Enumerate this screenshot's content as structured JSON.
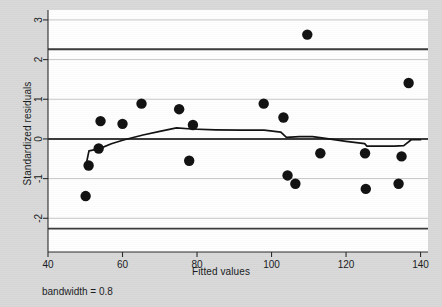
{
  "figure": {
    "background_color": "#d9d9d9",
    "panel_color": "#ffffff",
    "note": "bandwidth = 0.8"
  },
  "chart_data": {
    "type": "scatter",
    "title": "",
    "subtitle": "",
    "xlabel": "Fitted values",
    "ylabel": "Standardized residuals",
    "xlim": [
      40,
      142
    ],
    "ylim": [
      -2.85,
      3.25
    ],
    "xticks": [
      40,
      60,
      80,
      100,
      120,
      140
    ],
    "xtick_labels": [
      "40",
      "60",
      "80",
      "100",
      "120",
      "140"
    ],
    "yticks": [
      -2,
      -1,
      0,
      1,
      2,
      3
    ],
    "ytick_labels": [
      "-2",
      "-1",
      "0",
      "1",
      "2",
      "3"
    ],
    "grid": true,
    "grid_axis": "y",
    "grid_color": "#c8c8c8",
    "legend": false,
    "legend_position": "none",
    "marker_color": "#111111",
    "marker_size": 5.2,
    "series": [
      {
        "name": "Standardized residuals vs fitted values",
        "type": "scatter",
        "points": [
          {
            "x": 50.1,
            "y": -1.44
          },
          {
            "x": 50.9,
            "y": -0.67
          },
          {
            "x": 53.6,
            "y": -0.24
          },
          {
            "x": 54.1,
            "y": 0.45
          },
          {
            "x": 60.0,
            "y": 0.38
          },
          {
            "x": 65.1,
            "y": 0.89
          },
          {
            "x": 75.2,
            "y": 0.75
          },
          {
            "x": 77.9,
            "y": -0.55
          },
          {
            "x": 78.9,
            "y": 0.35
          },
          {
            "x": 97.9,
            "y": 0.89
          },
          {
            "x": 103.2,
            "y": 0.54
          },
          {
            "x": 104.3,
            "y": -0.92
          },
          {
            "x": 106.4,
            "y": -1.13
          },
          {
            "x": 109.6,
            "y": 2.63
          },
          {
            "x": 113.1,
            "y": -0.36
          },
          {
            "x": 125.1,
            "y": -0.36
          },
          {
            "x": 125.3,
            "y": -1.26
          },
          {
            "x": 134.1,
            "y": -1.13
          },
          {
            "x": 134.9,
            "y": -0.44
          },
          {
            "x": 136.8,
            "y": 1.41
          }
        ]
      },
      {
        "name": "lowess smoother",
        "type": "line",
        "color": "#111111",
        "points": [
          {
            "x": 50.2,
            "y": -0.66
          },
          {
            "x": 51.0,
            "y": -0.3
          },
          {
            "x": 53.7,
            "y": -0.25
          },
          {
            "x": 57.0,
            "y": -0.12
          },
          {
            "x": 60.5,
            "y": -0.02
          },
          {
            "x": 65.5,
            "y": 0.1
          },
          {
            "x": 70.0,
            "y": 0.19
          },
          {
            "x": 74.5,
            "y": 0.28
          },
          {
            "x": 78.5,
            "y": 0.25
          },
          {
            "x": 85.0,
            "y": 0.23
          },
          {
            "x": 92.0,
            "y": 0.22
          },
          {
            "x": 98.0,
            "y": 0.22
          },
          {
            "x": 102.5,
            "y": 0.17
          },
          {
            "x": 104.0,
            "y": 0.04
          },
          {
            "x": 107.5,
            "y": 0.06
          },
          {
            "x": 111.0,
            "y": 0.06
          },
          {
            "x": 114.0,
            "y": 0.02
          },
          {
            "x": 120.0,
            "y": -0.06
          },
          {
            "x": 125.0,
            "y": -0.12
          },
          {
            "x": 125.6,
            "y": -0.18
          },
          {
            "x": 133.0,
            "y": -0.18
          },
          {
            "x": 135.5,
            "y": -0.17
          },
          {
            "x": 137.5,
            "y": -0.02
          },
          {
            "x": 140.0,
            "y": -0.02
          }
        ]
      }
    ],
    "reference_lines": [
      {
        "name": "zero-line",
        "orientation": "horizontal",
        "y": 0.0,
        "color": "#3a3a3a"
      },
      {
        "name": "upper-limit-line",
        "orientation": "horizontal",
        "y": 2.26,
        "color": "#3a3a3a"
      },
      {
        "name": "lower-limit-line",
        "orientation": "horizontal",
        "y": -2.26,
        "color": "#3a3a3a"
      }
    ]
  }
}
